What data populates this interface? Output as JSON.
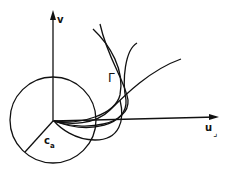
{
  "diagram": {
    "axes": {
      "vertical_label": "v",
      "horizontal_label": "u"
    },
    "circle_label_main": "c",
    "circle_label_sub": "a",
    "curve_label": "Γ",
    "corner_mark": "⌟",
    "colors": {
      "ink": "#111111",
      "background": "#ffffff"
    }
  }
}
